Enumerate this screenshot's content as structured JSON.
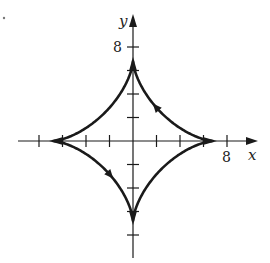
{
  "chart_data": {
    "type": "line",
    "title": "",
    "xlabel": "x",
    "ylabel": "y",
    "x_tick_label": "8",
    "y_tick_label": "8",
    "tick_step": 2,
    "xlim": [
      -11,
      10
    ],
    "ylim": [
      -10,
      11
    ],
    "grid": false,
    "legend": null,
    "series": [
      {
        "name": "astroid",
        "equation": "x = a cos^3 t, y = a sin^3 t",
        "a": 6.8,
        "cusps": [
          [
            6.8,
            0
          ],
          [
            0,
            6.8
          ],
          [
            -6.8,
            0
          ],
          [
            0,
            -6.8
          ]
        ],
        "direction": "counterclockwise",
        "arrow_markers": [
          {
            "quadrant": "I",
            "points": "up-left"
          },
          {
            "quadrant": "III",
            "points": "down-right"
          }
        ]
      }
    ]
  },
  "figure_marker": "•",
  "colors": {
    "ink": "#1a1a1a",
    "background": "#ffffff"
  }
}
